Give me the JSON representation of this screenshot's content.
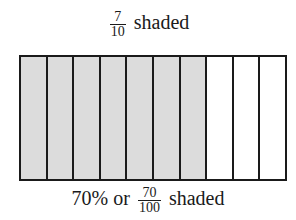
{
  "top_label": {
    "fraction": {
      "numerator": "7",
      "denominator": "10"
    },
    "text": "shaded"
  },
  "grid": {
    "total_parts": 10,
    "shaded_parts": 7,
    "shade_color": "#dcdcdc",
    "cells": [
      true,
      true,
      true,
      true,
      true,
      true,
      true,
      false,
      false,
      false
    ]
  },
  "bottom_label": {
    "percent": "70%",
    "connector": "or",
    "fraction": {
      "numerator": "70",
      "denominator": "100"
    },
    "text": "shaded"
  }
}
